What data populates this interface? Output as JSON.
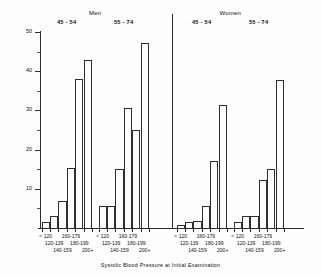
{
  "chart_data": {
    "type": "bar",
    "title": "",
    "xlabel": "Systolic Blood Pressure at Initial Examination",
    "ylabel": "Percent",
    "ylim": [
      0,
      50
    ],
    "yticks": [
      0,
      10,
      20,
      30,
      40,
      50
    ],
    "ytick_labels": [
      "",
      "10",
      "20",
      "30",
      "40",
      "50"
    ],
    "grid": false,
    "legend": false,
    "categories": [
      "< 120",
      "120-139",
      "140-159",
      "160-179",
      "180-199",
      "200+"
    ],
    "panels": [
      {
        "sex": "Men",
        "age": "45 - 54",
        "values": [
          1.5,
          3.0,
          7.0,
          15.2,
          38.0,
          42.8
        ]
      },
      {
        "sex": "Men",
        "age": "55 - 74",
        "values": [
          5.6,
          5.6,
          15.0,
          30.7,
          25.0,
          47.2
        ]
      },
      {
        "sex": "Women",
        "age": "45 - 54",
        "values": [
          0.8,
          1.5,
          1.8,
          5.6,
          17.0,
          31.5
        ]
      },
      {
        "sex": "Women",
        "age": "55 - 74",
        "values": [
          1.5,
          3.0,
          3.0,
          12.2,
          15.0,
          37.8
        ]
      }
    ]
  },
  "headers": {
    "men": "Men",
    "women": "Women",
    "age_45_54": "45 - 54",
    "age_55_74": "55 - 74"
  },
  "axes": {
    "ytitle": "Percent",
    "xtitle": "Systolic Blood Pressure at Initial Examination"
  },
  "xlabel_rows": {
    "row1": [
      "< 120",
      "160-179"
    ],
    "row2": [
      "120-139",
      "180-199"
    ],
    "row3": [
      "140-159",
      "200+"
    ]
  }
}
